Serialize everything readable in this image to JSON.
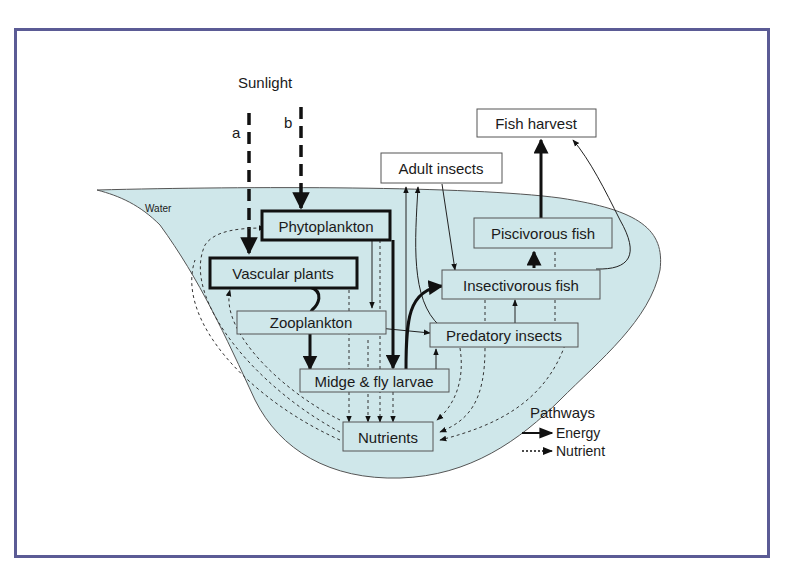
{
  "diagram": {
    "title_source": "Sunlight",
    "sunlight_paths": [
      {
        "label": "a",
        "target": "Vascular plants"
      },
      {
        "label": "b",
        "target": "Phytoplankton"
      }
    ],
    "water_label": "Water",
    "nodes": {
      "fish_harvest": "Fish harvest",
      "adult_insects": "Adult insects",
      "phytoplankton": "Phytoplankton",
      "vascular_plants": "Vascular plants",
      "zooplankton": "Zooplankton",
      "piscivorous_fish": "Piscivorous fish",
      "insectivorous_fish": "Insectivorous fish",
      "predatory_insects": "Predatory insects",
      "midge_fly_larvae": "Midge & fly larvae",
      "nutrients": "Nutrients"
    },
    "legend": {
      "title": "Pathways",
      "energy": "Energy",
      "nutrient": "Nutrient"
    },
    "colors": {
      "water": "#cfe7ea",
      "frame": "#5b5b95"
    }
  }
}
